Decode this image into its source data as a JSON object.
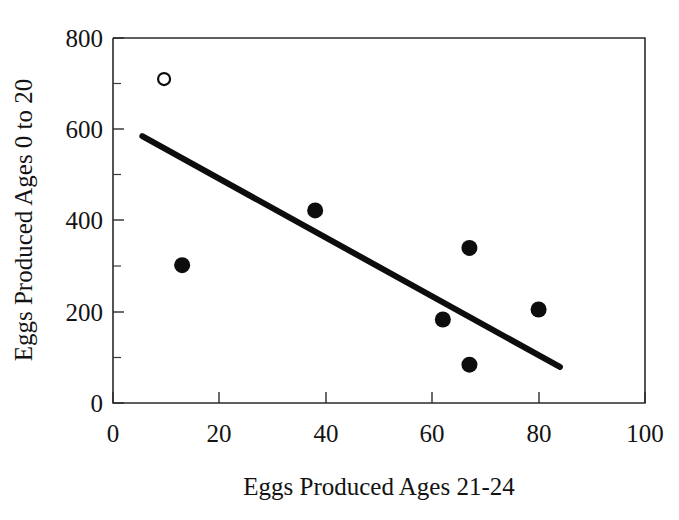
{
  "chart_data": {
    "type": "scatter",
    "title": "",
    "xlabel": "Eggs Produced Ages 21-24",
    "ylabel": "Eggs Produced Ages 0 to 20",
    "xlim": [
      0,
      100
    ],
    "ylim": [
      0,
      800
    ],
    "xticks": [
      0,
      20,
      40,
      60,
      80,
      100
    ],
    "xtick_labels": [
      "0",
      "20",
      "40",
      "60",
      "80",
      "100"
    ],
    "yticks": [
      0,
      200,
      400,
      600,
      800
    ],
    "ytick_labels": [
      "0",
      "200",
      "400",
      "600",
      "800"
    ],
    "yticks_minor": [
      100,
      300,
      500,
      700
    ],
    "grid": false,
    "legend": false,
    "series": [
      {
        "name": "open-point",
        "marker": "open-circle",
        "color": "#0d0d0d",
        "points": [
          {
            "x": 9.6,
            "y": 710
          }
        ]
      },
      {
        "name": "filled-points",
        "marker": "filled-circle",
        "color": "#0d0d0d",
        "points": [
          {
            "x": 13,
            "y": 302
          },
          {
            "x": 38,
            "y": 422
          },
          {
            "x": 62,
            "y": 183
          },
          {
            "x": 67,
            "y": 340
          },
          {
            "x": 67,
            "y": 84
          },
          {
            "x": 80,
            "y": 205
          }
        ]
      }
    ],
    "trendline": {
      "name": "regression-line",
      "color": "#0d0d0d",
      "x1": 5.5,
      "y1": 585,
      "x2": 84,
      "y2": 79
    }
  },
  "axes": {
    "x_axis_title": "Eggs Produced Ages 21-24",
    "y_axis_title": "Eggs Produced Ages 0 to 20"
  },
  "ticks": {
    "x": [
      "0",
      "20",
      "40",
      "60",
      "80",
      "100"
    ],
    "y": [
      "0",
      "200",
      "400",
      "600",
      "800"
    ]
  }
}
